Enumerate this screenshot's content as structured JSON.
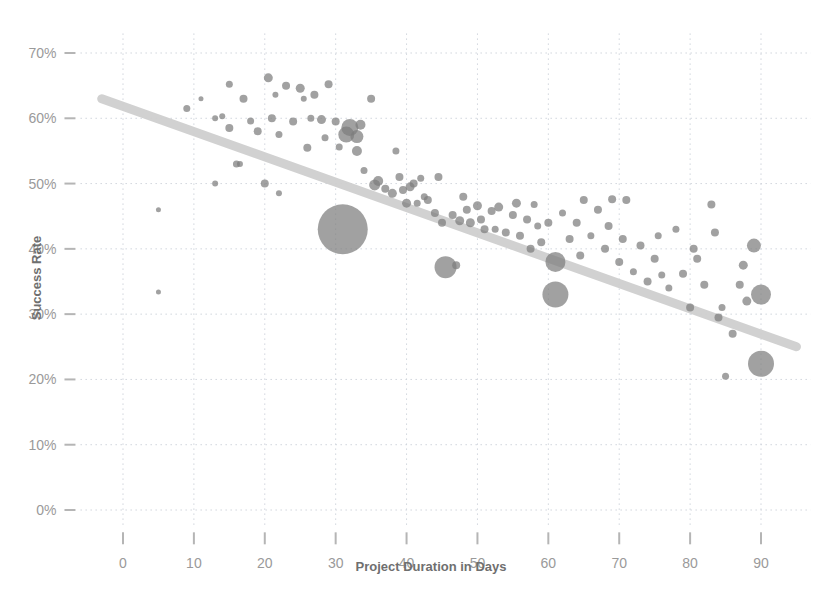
{
  "chart_data": {
    "type": "scatter",
    "title": "",
    "xlabel": "Project Duration in Days",
    "ylabel": "Success Rate",
    "xlim": [
      -6,
      97
    ],
    "ylim": [
      -2.5,
      73
    ],
    "xticks": [
      0,
      10,
      20,
      30,
      40,
      50,
      60,
      70,
      80,
      90
    ],
    "xtick_labels": [
      "0",
      "10",
      "20",
      "30",
      "40",
      "50",
      "60",
      "70",
      "80",
      "90"
    ],
    "yticks": [
      0,
      10,
      20,
      30,
      40,
      50,
      60,
      70
    ],
    "ytick_labels": [
      "0%",
      "10%",
      "20%",
      "30%",
      "40%",
      "50%",
      "60%",
      "70%"
    ],
    "grid": true,
    "legend": "none",
    "marker_encoding": "bubble-size-by-weight",
    "bubble_color": "#7d7d7d",
    "trendline": {
      "type": "linear",
      "color": "#cfcfcf",
      "x_start": -3,
      "y_start": 63.0,
      "x_end": 95,
      "y_end": 25.0
    },
    "points": [
      {
        "x": 5,
        "y": 46.0,
        "r": 2.5
      },
      {
        "x": 5,
        "y": 33.4,
        "r": 2.5
      },
      {
        "x": 9,
        "y": 61.5,
        "r": 3.5
      },
      {
        "x": 11,
        "y": 63.0,
        "r": 2.5
      },
      {
        "x": 13,
        "y": 50.0,
        "r": 3.0
      },
      {
        "x": 13,
        "y": 60.0,
        "r": 3.0
      },
      {
        "x": 14,
        "y": 60.3,
        "r": 3.0
      },
      {
        "x": 15,
        "y": 65.2,
        "r": 3.5
      },
      {
        "x": 15,
        "y": 58.5,
        "r": 4.0
      },
      {
        "x": 16,
        "y": 53.0,
        "r": 3.5
      },
      {
        "x": 16.5,
        "y": 53.0,
        "r": 3.0
      },
      {
        "x": 17,
        "y": 63.0,
        "r": 4.0
      },
      {
        "x": 18,
        "y": 59.6,
        "r": 3.5
      },
      {
        "x": 19,
        "y": 58.0,
        "r": 4.0
      },
      {
        "x": 20,
        "y": 50.0,
        "r": 4.0
      },
      {
        "x": 20.5,
        "y": 66.2,
        "r": 4.5
      },
      {
        "x": 21,
        "y": 60.0,
        "r": 4.0
      },
      {
        "x": 21.5,
        "y": 63.6,
        "r": 3.0
      },
      {
        "x": 22,
        "y": 57.5,
        "r": 3.5
      },
      {
        "x": 22,
        "y": 48.5,
        "r": 3.0
      },
      {
        "x": 23,
        "y": 65.0,
        "r": 4.0
      },
      {
        "x": 24,
        "y": 59.5,
        "r": 4.0
      },
      {
        "x": 25,
        "y": 64.6,
        "r": 4.5
      },
      {
        "x": 25.5,
        "y": 63.0,
        "r": 3.0
      },
      {
        "x": 26,
        "y": 55.5,
        "r": 4.0
      },
      {
        "x": 26.5,
        "y": 60.0,
        "r": 3.5
      },
      {
        "x": 27,
        "y": 63.6,
        "r": 4.0
      },
      {
        "x": 28,
        "y": 59.8,
        "r": 4.5
      },
      {
        "x": 28.5,
        "y": 57.0,
        "r": 3.5
      },
      {
        "x": 29,
        "y": 65.2,
        "r": 4.0
      },
      {
        "x": 30,
        "y": 59.5,
        "r": 4.0
      },
      {
        "x": 30.5,
        "y": 55.6,
        "r": 3.5
      },
      {
        "x": 31,
        "y": 43.0,
        "r": 25.0
      },
      {
        "x": 31.5,
        "y": 57.5,
        "r": 8.0
      },
      {
        "x": 32,
        "y": 58.6,
        "r": 8.5
      },
      {
        "x": 33,
        "y": 57.2,
        "r": 6.5
      },
      {
        "x": 33.5,
        "y": 59.0,
        "r": 5.0
      },
      {
        "x": 33,
        "y": 55.0,
        "r": 5.0
      },
      {
        "x": 34,
        "y": 52.0,
        "r": 3.5
      },
      {
        "x": 35,
        "y": 63.0,
        "r": 4.0
      },
      {
        "x": 35.5,
        "y": 49.8,
        "r": 5.5
      },
      {
        "x": 36,
        "y": 50.4,
        "r": 5.0
      },
      {
        "x": 37,
        "y": 49.2,
        "r": 4.0
      },
      {
        "x": 38,
        "y": 48.5,
        "r": 4.5
      },
      {
        "x": 38.5,
        "y": 55.0,
        "r": 3.5
      },
      {
        "x": 39,
        "y": 51.0,
        "r": 4.0
      },
      {
        "x": 39.5,
        "y": 49.0,
        "r": 4.0
      },
      {
        "x": 40,
        "y": 47.0,
        "r": 4.5
      },
      {
        "x": 40.5,
        "y": 49.5,
        "r": 4.5
      },
      {
        "x": 41,
        "y": 50.0,
        "r": 4.0
      },
      {
        "x": 41.5,
        "y": 47.0,
        "r": 3.5
      },
      {
        "x": 42,
        "y": 50.8,
        "r": 3.5
      },
      {
        "x": 42.5,
        "y": 48.0,
        "r": 3.5
      },
      {
        "x": 43,
        "y": 47.5,
        "r": 4.0
      },
      {
        "x": 44,
        "y": 45.5,
        "r": 4.0
      },
      {
        "x": 44.5,
        "y": 51.0,
        "r": 4.0
      },
      {
        "x": 45,
        "y": 44.0,
        "r": 4.0
      },
      {
        "x": 45.5,
        "y": 37.2,
        "r": 11.0
      },
      {
        "x": 46.5,
        "y": 45.2,
        "r": 4.0
      },
      {
        "x": 47,
        "y": 37.5,
        "r": 4.0
      },
      {
        "x": 47.5,
        "y": 44.3,
        "r": 4.5
      },
      {
        "x": 48,
        "y": 48.0,
        "r": 4.0
      },
      {
        "x": 48.5,
        "y": 46.0,
        "r": 4.0
      },
      {
        "x": 49,
        "y": 44.0,
        "r": 4.5
      },
      {
        "x": 50,
        "y": 46.6,
        "r": 4.5
      },
      {
        "x": 50.5,
        "y": 44.5,
        "r": 4.0
      },
      {
        "x": 51,
        "y": 43.0,
        "r": 4.0
      },
      {
        "x": 52,
        "y": 45.8,
        "r": 4.0
      },
      {
        "x": 52.5,
        "y": 43.0,
        "r": 3.5
      },
      {
        "x": 53,
        "y": 46.4,
        "r": 4.5
      },
      {
        "x": 54,
        "y": 42.5,
        "r": 4.0
      },
      {
        "x": 55,
        "y": 45.2,
        "r": 4.0
      },
      {
        "x": 55.5,
        "y": 47.0,
        "r": 4.5
      },
      {
        "x": 56,
        "y": 42.0,
        "r": 4.0
      },
      {
        "x": 57,
        "y": 44.5,
        "r": 4.0
      },
      {
        "x": 57.5,
        "y": 40.0,
        "r": 4.0
      },
      {
        "x": 58,
        "y": 46.8,
        "r": 3.5
      },
      {
        "x": 58.5,
        "y": 43.5,
        "r": 3.5
      },
      {
        "x": 59,
        "y": 41.0,
        "r": 4.0
      },
      {
        "x": 60,
        "y": 44.0,
        "r": 4.0
      },
      {
        "x": 61,
        "y": 38.0,
        "r": 10.0
      },
      {
        "x": 61,
        "y": 33.0,
        "r": 13.0
      },
      {
        "x": 62,
        "y": 45.5,
        "r": 3.5
      },
      {
        "x": 63,
        "y": 41.5,
        "r": 4.0
      },
      {
        "x": 64,
        "y": 44.0,
        "r": 4.0
      },
      {
        "x": 64.5,
        "y": 39.0,
        "r": 4.0
      },
      {
        "x": 65,
        "y": 47.5,
        "r": 4.0
      },
      {
        "x": 66,
        "y": 42.0,
        "r": 3.5
      },
      {
        "x": 67,
        "y": 46.0,
        "r": 4.0
      },
      {
        "x": 68,
        "y": 40.0,
        "r": 4.0
      },
      {
        "x": 68.5,
        "y": 43.5,
        "r": 4.0
      },
      {
        "x": 69,
        "y": 47.6,
        "r": 4.0
      },
      {
        "x": 70,
        "y": 38.0,
        "r": 4.0
      },
      {
        "x": 70.5,
        "y": 41.5,
        "r": 4.0
      },
      {
        "x": 71,
        "y": 47.5,
        "r": 4.0
      },
      {
        "x": 72,
        "y": 36.5,
        "r": 3.5
      },
      {
        "x": 73,
        "y": 40.5,
        "r": 4.0
      },
      {
        "x": 74,
        "y": 35.0,
        "r": 4.0
      },
      {
        "x": 75,
        "y": 38.5,
        "r": 4.0
      },
      {
        "x": 75.5,
        "y": 42.0,
        "r": 3.5
      },
      {
        "x": 76,
        "y": 36.0,
        "r": 3.5
      },
      {
        "x": 77,
        "y": 34.0,
        "r": 3.5
      },
      {
        "x": 78,
        "y": 43.0,
        "r": 3.5
      },
      {
        "x": 79,
        "y": 36.2,
        "r": 4.0
      },
      {
        "x": 80,
        "y": 31.0,
        "r": 4.0
      },
      {
        "x": 80.5,
        "y": 40.0,
        "r": 4.0
      },
      {
        "x": 81,
        "y": 38.5,
        "r": 4.0
      },
      {
        "x": 82,
        "y": 34.5,
        "r": 4.0
      },
      {
        "x": 83,
        "y": 46.8,
        "r": 4.0
      },
      {
        "x": 83.5,
        "y": 42.5,
        "r": 4.0
      },
      {
        "x": 84,
        "y": 29.5,
        "r": 4.0
      },
      {
        "x": 84.5,
        "y": 31.0,
        "r": 3.5
      },
      {
        "x": 85,
        "y": 20.5,
        "r": 3.5
      },
      {
        "x": 86,
        "y": 27.0,
        "r": 4.0
      },
      {
        "x": 87,
        "y": 34.5,
        "r": 4.0
      },
      {
        "x": 87.5,
        "y": 37.5,
        "r": 4.5
      },
      {
        "x": 88,
        "y": 32.0,
        "r": 4.5
      },
      {
        "x": 89,
        "y": 40.5,
        "r": 7.0
      },
      {
        "x": 90,
        "y": 33.0,
        "r": 10.0
      },
      {
        "x": 90,
        "y": 22.4,
        "r": 13.0
      }
    ]
  },
  "axes": {
    "x_title": "Project Duration in Days",
    "y_title": "Success Rate"
  }
}
